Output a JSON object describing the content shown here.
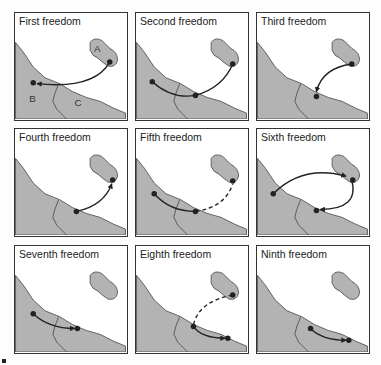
{
  "diagram": {
    "colors": {
      "land": "#b3b3b3",
      "sea": "#ffffff",
      "border": "#333333",
      "route": "#222222"
    },
    "labels": {
      "A": "A",
      "B": "B",
      "C": "C"
    },
    "panels": [
      {
        "title": "First freedom",
        "routes": "B to A, over C"
      },
      {
        "title": "Second freedom",
        "routes": "B to A with stop in C"
      },
      {
        "title": "Third freedom",
        "routes": "A to C"
      },
      {
        "title": "Fourth freedom",
        "routes": "C to A"
      },
      {
        "title": "Fifth freedom",
        "routes": "B to C, continuing to A (dashed)"
      },
      {
        "title": "Sixth freedom",
        "routes": "B to A, A to C"
      },
      {
        "title": "Seventh freedom",
        "routes": "B to C"
      },
      {
        "title": "Eighth freedom",
        "routes": "A to C (dashed), C to C"
      },
      {
        "title": "Ninth freedom",
        "routes": "C to C"
      }
    ]
  }
}
